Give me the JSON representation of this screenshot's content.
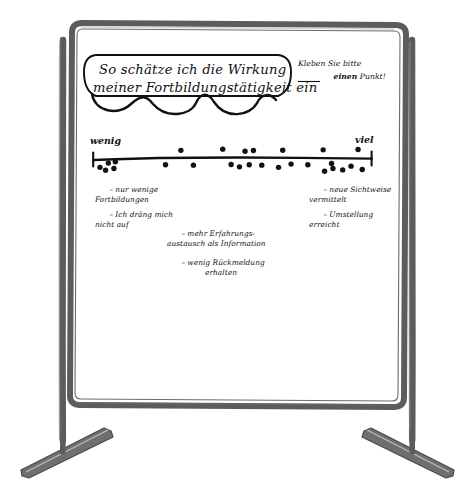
{
  "scene": {
    "kind": "flipchart-on-easel",
    "board_background": "#ffffff",
    "frame_color": "#5c5c5c",
    "ink_color": "#111111"
  },
  "board": {
    "title_bubble": {
      "line1": "So schätze ich die Wirkung",
      "line2": "meiner Fortbildungstätigkeit ein"
    },
    "instruction": {
      "line1": "Kleben Sie bitte",
      "line2_underlined": "einen",
      "line2_rest": " Punkt!"
    },
    "scale": {
      "left_label": "wenig",
      "right_label": "viel"
    },
    "annotations": {
      "left": [
        {
          "bullet": "–",
          "line1": "nur wenige",
          "line2": "Fortbildungen"
        },
        {
          "bullet": "–",
          "line1": "Ich dräng mich",
          "line2": "nicht auf"
        }
      ],
      "middle": [
        {
          "bullet": "–",
          "line1": "mehr Erfahrungs-",
          "line2": "austausch als Information"
        },
        {
          "bullet": "–",
          "line1": "wenig Rückmeldung",
          "line2": "erhalten"
        }
      ],
      "right": [
        {
          "bullet": "–",
          "line1": "neue Sichtweise",
          "line2": "vermittelt"
        },
        {
          "bullet": "–",
          "line1": "Umstellung",
          "line2": "erreicht"
        }
      ]
    }
  },
  "chart_data": {
    "type": "scatter",
    "title": "So schätze ich die Wirkung meiner Fortbildungstätigkeit ein",
    "xlabel": "",
    "ylabel": "",
    "xlim": [
      0,
      100
    ],
    "ylim": [
      -1,
      1
    ],
    "grid": false,
    "legend": null,
    "axis_tick_labels": [
      "wenig",
      "viel"
    ],
    "note": "Dot-voting (Punktabfrage): each dot is one participant's sticker placed along a wenig–viel continuum. y offset is only jitter to avoid overlap.",
    "points": [
      {
        "x": 2.5,
        "y": -0.55
      },
      {
        "x": 5.5,
        "y": -0.3
      },
      {
        "x": 8.0,
        "y": -0.22
      },
      {
        "x": 4.5,
        "y": -0.72
      },
      {
        "x": 7.5,
        "y": -0.62
      },
      {
        "x": 26.0,
        "y": -0.4
      },
      {
        "x": 31.5,
        "y": 0.45
      },
      {
        "x": 36.0,
        "y": -0.42
      },
      {
        "x": 46.5,
        "y": 0.52
      },
      {
        "x": 49.5,
        "y": -0.38
      },
      {
        "x": 52.5,
        "y": -0.52
      },
      {
        "x": 54.5,
        "y": 0.4
      },
      {
        "x": 57.5,
        "y": 0.44
      },
      {
        "x": 56.0,
        "y": -0.4
      },
      {
        "x": 60.5,
        "y": -0.42
      },
      {
        "x": 68.0,
        "y": 0.46
      },
      {
        "x": 66.5,
        "y": -0.55
      },
      {
        "x": 71.0,
        "y": -0.36
      },
      {
        "x": 77.0,
        "y": -0.4
      },
      {
        "x": 82.5,
        "y": 0.48
      },
      {
        "x": 85.5,
        "y": -0.32
      },
      {
        "x": 86.0,
        "y": -0.62
      },
      {
        "x": 83.0,
        "y": -0.78
      },
      {
        "x": 89.5,
        "y": -0.7
      },
      {
        "x": 92.5,
        "y": -0.48
      },
      {
        "x": 95.0,
        "y": 0.5
      },
      {
        "x": 96.5,
        "y": -0.68
      }
    ],
    "counts_by_zone": {
      "wenig": 5,
      "links_mitte": 3,
      "mitte": 8,
      "rechts_mitte": 4,
      "viel": 7
    }
  }
}
